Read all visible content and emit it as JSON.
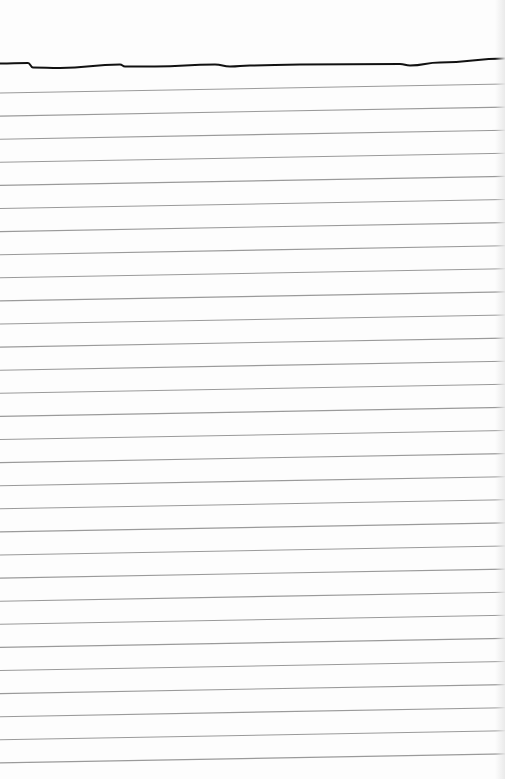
{
  "paper": {
    "type": "ruled-notebook-page",
    "background_color": "#fdfdfd",
    "rule_color": "#9a9a9a",
    "ink_color": "#111111",
    "rule_spacing_px": 23.1,
    "rule_count": 30,
    "rule_first_left_y": 93,
    "rule_tilt_px": -9,
    "hand_drawn_line": {
      "description": "hand-drawn black ink line across top of page",
      "points": [
        [
          0,
          63.5
        ],
        [
          28,
          63
        ],
        [
          33,
          67.5
        ],
        [
          60,
          68
        ],
        [
          120,
          64.5
        ],
        [
          125,
          66.5
        ],
        [
          155,
          66.5
        ],
        [
          215,
          64.5
        ],
        [
          230,
          66.5
        ],
        [
          250,
          65.5
        ],
        [
          300,
          64.5
        ],
        [
          400,
          64
        ],
        [
          410,
          65.5
        ],
        [
          440,
          62.5
        ],
        [
          505,
          58.5
        ]
      ]
    }
  }
}
